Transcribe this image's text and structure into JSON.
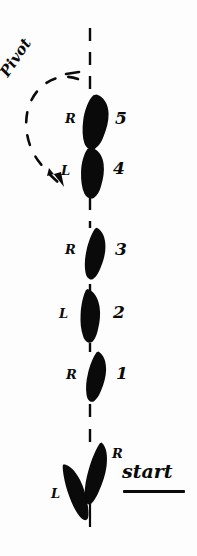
{
  "figure": {
    "background_color": "#fdfdfd",
    "ink_color": "#0a0a0a",
    "width": 197,
    "height": 556
  },
  "annotations": {
    "pivot": "Pivot",
    "start": "start"
  },
  "steps": [
    {
      "number": "5",
      "foot": "R",
      "foot_x": 95,
      "foot_y": 122,
      "angle": 3,
      "label_x": 66,
      "label_y": 112,
      "num_x": 116,
      "num_y": 110
    },
    {
      "number": "4",
      "foot": "L",
      "foot_x": 92,
      "foot_y": 173,
      "angle": -3,
      "label_x": 62,
      "label_y": 164,
      "num_x": 114,
      "num_y": 161
    },
    {
      "number": "3",
      "foot": "R",
      "foot_x": 95,
      "foot_y": 254,
      "angle": 4,
      "label_x": 66,
      "label_y": 243,
      "num_x": 116,
      "num_y": 242
    },
    {
      "number": "2",
      "foot": "L",
      "foot_x": 90,
      "foot_y": 316,
      "angle": -5,
      "label_x": 60,
      "label_y": 307,
      "num_x": 114,
      "num_y": 305
    },
    {
      "number": "1",
      "foot": "R",
      "foot_x": 96,
      "foot_y": 377,
      "angle": 5,
      "label_x": 67,
      "label_y": 368,
      "num_x": 117,
      "num_y": 366
    }
  ],
  "start_feet": [
    {
      "foot": "R",
      "foot_x": 96,
      "foot_y": 474,
      "angle": 10,
      "label_x": 113,
      "label_y": 450
    },
    {
      "foot": "L",
      "foot_x": 75,
      "foot_y": 491,
      "angle": -22,
      "label_x": 52,
      "label_y": 490
    }
  ],
  "center_line": {
    "x": 90,
    "y_top": 28,
    "y_bottom": 527,
    "style": "dashed"
  },
  "pivot_arc": {
    "label_x": 8,
    "label_y": 60,
    "label_rotation": -58,
    "arrow_tip_x": 62,
    "arrow_tip_y": 186,
    "style": "dashed-curve-counterclockwise"
  },
  "start_underline": {
    "x": 123,
    "y": 490,
    "width": 62
  },
  "start_text": {
    "x": 122,
    "y": 464
  },
  "colors": {
    "ink": "#0a0a0a",
    "paper": "#fdfdfd"
  }
}
